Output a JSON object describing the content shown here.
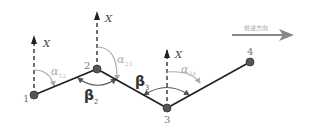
{
  "diagram": {
    "direction_label": "前进方向",
    "axis_label": "X",
    "colors": {
      "line": "#222222",
      "axis": "#222222",
      "point_fill": "#555555",
      "alpha_arc": "#b0b0b0",
      "beta_arc": "#555555",
      "direction_arrow": "#888888"
    },
    "points": [
      {
        "id": "1",
        "label": "1"
      },
      {
        "id": "2",
        "label": "2"
      },
      {
        "id": "3",
        "label": "3"
      },
      {
        "id": "4",
        "label": "4"
      }
    ],
    "azimuths": [
      {
        "symbol": "α",
        "sub": "12"
      },
      {
        "symbol": "α",
        "sub": "23"
      },
      {
        "symbol": "α",
        "sub": "34"
      }
    ],
    "turning_angles": [
      {
        "symbol": "β",
        "sub": "2"
      },
      {
        "symbol": "β",
        "sub": "3"
      }
    ]
  }
}
